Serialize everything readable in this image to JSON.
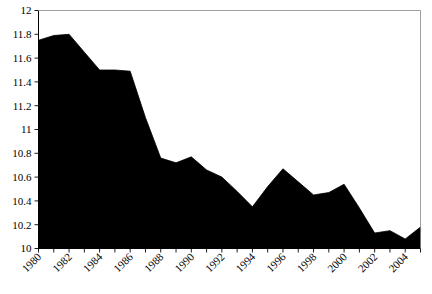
{
  "chart_data": {
    "type": "area",
    "title": "",
    "subtitle": "",
    "xlabel": "",
    "ylabel": "",
    "xlim": [
      1980,
      2005
    ],
    "ylim": [
      10,
      12
    ],
    "grid": false,
    "legend": null,
    "fill_color": "#000000",
    "line_color": "#000000",
    "frame_color": "#000000",
    "background_color": "#ffffff",
    "x": [
      1980,
      1981,
      1982,
      1983,
      1984,
      1985,
      1986,
      1987,
      1988,
      1989,
      1990,
      1991,
      1992,
      1993,
      1994,
      1995,
      1996,
      1997,
      1998,
      1999,
      2000,
      2001,
      2002,
      2003,
      2004,
      2005
    ],
    "values": [
      11.75,
      11.79,
      11.8,
      11.65,
      11.5,
      11.5,
      11.49,
      11.1,
      10.76,
      10.72,
      10.77,
      10.66,
      10.6,
      10.48,
      10.35,
      10.52,
      10.67,
      10.56,
      10.45,
      10.47,
      10.54,
      10.34,
      10.13,
      10.15,
      10.08,
      10.18
    ],
    "ytick_values": [
      10,
      10.2,
      10.4,
      10.6,
      10.8,
      11,
      11.2,
      11.4,
      11.6,
      11.8,
      12
    ],
    "ytick_labels": [
      "10",
      "10.2",
      "10.4",
      "10.6",
      "10.8",
      "11",
      "11.2",
      "11.4",
      "11.6",
      "11.8",
      "12"
    ],
    "xtick_values": [
      1980,
      1981,
      1982,
      1983,
      1984,
      1985,
      1986,
      1987,
      1988,
      1989,
      1990,
      1991,
      1992,
      1993,
      1994,
      1995,
      1996,
      1997,
      1998,
      1999,
      2000,
      2001,
      2002,
      2003,
      2004,
      2005
    ],
    "xtick_labels_shown": [
      "1980",
      "1982",
      "1984",
      "1986",
      "1988",
      "1990",
      "1992",
      "1994",
      "1996",
      "1998",
      "2000",
      "2002",
      "2004"
    ],
    "xtick_label_rotation_deg": -45
  }
}
